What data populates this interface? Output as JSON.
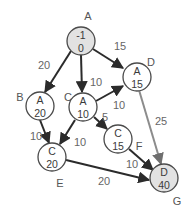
{
  "diagram": {
    "colors": {
      "node_fill": "#ffffff",
      "highlight_fill": "#e2e2e2",
      "edge": "#2b2b2b",
      "highlight_edge": "#8c8c8c",
      "text": "#555555"
    },
    "nodes": [
      {
        "id": "A",
        "label": "A",
        "pred": "-1",
        "dist": "0",
        "highlight": true
      },
      {
        "id": "B",
        "label": "B",
        "pred": "A",
        "dist": "20",
        "highlight": false
      },
      {
        "id": "C",
        "label": "C",
        "pred": "A",
        "dist": "10",
        "highlight": false
      },
      {
        "id": "D",
        "label": "D",
        "pred": "A",
        "dist": "15",
        "highlight": false
      },
      {
        "id": "E",
        "label": "E",
        "pred": "C",
        "dist": "20",
        "highlight": false
      },
      {
        "id": "F",
        "label": "F",
        "pred": "C",
        "dist": "15",
        "highlight": false
      },
      {
        "id": "G",
        "label": "G",
        "pred": "D",
        "dist": "40",
        "highlight": true
      }
    ],
    "edges": [
      {
        "from": "A",
        "to": "B",
        "weight": "20"
      },
      {
        "from": "A",
        "to": "C",
        "weight": "10"
      },
      {
        "from": "A",
        "to": "D",
        "weight": "15"
      },
      {
        "from": "C",
        "to": "D",
        "weight": "10"
      },
      {
        "from": "C",
        "to": "F",
        "weight": "5"
      },
      {
        "from": "C",
        "to": "E",
        "weight": "10"
      },
      {
        "from": "B",
        "to": "E",
        "weight": "10"
      },
      {
        "from": "D",
        "to": "G",
        "weight": "25",
        "highlight": true
      },
      {
        "from": "F",
        "to": "G",
        "weight": "10"
      },
      {
        "from": "E",
        "to": "G",
        "weight": "20"
      }
    ]
  }
}
